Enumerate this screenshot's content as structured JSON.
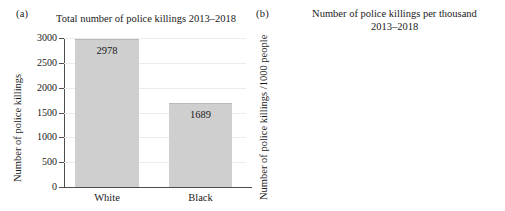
{
  "figure": {
    "panels": [
      {
        "tag": "(a)",
        "title": "Total number of police killings 2013–2018",
        "ylabel": "Number of police killings"
      },
      {
        "tag": "(b)",
        "title": "Number of police killings per thousand\n2013–2018",
        "title_line1": "Number of police killings per thousand",
        "title_line2": "2013–2018",
        "ylabel": "Number of police killings /1000 people"
      }
    ],
    "colors": {
      "bar_fill": "#cfcfcf",
      "bar_edge": "#b9b9b9",
      "axis": "#4d4d4d",
      "grid": "#ececec",
      "text": "#1a1a1a",
      "background": "#ffffff"
    }
  },
  "chart_data": [
    {
      "type": "bar",
      "title": "Total number of police killings 2013–2018",
      "xlabel": "",
      "ylabel": "Number of police killings",
      "categories": [
        "White",
        "Black"
      ],
      "values": [
        2978,
        1689
      ],
      "value_labels": [
        "2978",
        "1689"
      ],
      "ylim": [
        0,
        3000
      ],
      "yticks": [
        0,
        500,
        1000,
        1500,
        2000,
        2500,
        3000
      ],
      "ytick_labels": [
        "0",
        "500",
        "1000",
        "1500",
        "2000",
        "2500",
        "3000"
      ],
      "grid": true,
      "legend": "none"
    },
    {
      "type": "bar",
      "title": "Number of police killings per thousand 2013–2018",
      "xlabel": "",
      "ylabel": "Number of police killings /1000 people",
      "categories": [
        "White",
        "Black"
      ],
      "values": [
        1.2,
        3.94
      ],
      "value_labels": [
        "1.20",
        "3.94"
      ],
      "ylim": [
        0,
        4.0
      ],
      "yticks": [
        0.0,
        0.5,
        1.0,
        1.5,
        2.0,
        2.5,
        3.0,
        3.5,
        4.0
      ],
      "ytick_labels": [
        "0.0",
        "0.5",
        "1.0",
        "1.5",
        "2.0",
        "2.5",
        "3.0",
        "3.5",
        "4.0"
      ],
      "grid": true,
      "legend": "none"
    }
  ]
}
